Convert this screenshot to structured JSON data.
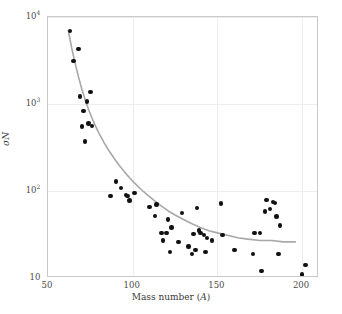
{
  "chart_data": {
    "type": "scatter",
    "title": "",
    "xlabel": "Mass number (A)",
    "ylabel": "σN",
    "xscale": "linear",
    "yscale": "log",
    "xlim": [
      50,
      210
    ],
    "ylim": [
      10,
      10000
    ],
    "grid": true,
    "legend": null,
    "xticks": [
      {
        "value": 50,
        "label": "50"
      },
      {
        "value": 100,
        "label": "100"
      },
      {
        "value": 150,
        "label": "150"
      },
      {
        "value": 200,
        "label": "200"
      }
    ],
    "yticks": [
      {
        "value": 10,
        "label": "10",
        "mantissa": "10",
        "exponent": ""
      },
      {
        "value": 100,
        "label": "10²",
        "mantissa": "10",
        "exponent": "2"
      },
      {
        "value": 1000,
        "label": "10³",
        "mantissa": "10",
        "exponent": "3"
      },
      {
        "value": 10000,
        "label": "10⁴",
        "mantissa": "10",
        "exponent": "4"
      }
    ],
    "marker": {
      "shape": "circle",
      "color": "#111111",
      "size_px": 4.4
    },
    "points": [
      {
        "x": 63,
        "y": 6900
      },
      {
        "x": 65,
        "y": 3100
      },
      {
        "x": 68,
        "y": 4300
      },
      {
        "x": 69,
        "y": 1220
      },
      {
        "x": 70,
        "y": 550
      },
      {
        "x": 71,
        "y": 830
      },
      {
        "x": 72,
        "y": 370
      },
      {
        "x": 73,
        "y": 1070
      },
      {
        "x": 74,
        "y": 600
      },
      {
        "x": 75,
        "y": 1380
      },
      {
        "x": 76,
        "y": 560
      },
      {
        "x": 87,
        "y": 88
      },
      {
        "x": 90,
        "y": 128
      },
      {
        "x": 93,
        "y": 108
      },
      {
        "x": 96,
        "y": 90
      },
      {
        "x": 97,
        "y": 87
      },
      {
        "x": 98,
        "y": 78
      },
      {
        "x": 101,
        "y": 95
      },
      {
        "x": 110,
        "y": 65
      },
      {
        "x": 113,
        "y": 52
      },
      {
        "x": 114,
        "y": 70
      },
      {
        "x": 117,
        "y": 33
      },
      {
        "x": 118,
        "y": 27
      },
      {
        "x": 120,
        "y": 33
      },
      {
        "x": 121,
        "y": 47
      },
      {
        "x": 122,
        "y": 20
      },
      {
        "x": 123,
        "y": 38
      },
      {
        "x": 127,
        "y": 26
      },
      {
        "x": 129,
        "y": 56
      },
      {
        "x": 133,
        "y": 23
      },
      {
        "x": 135,
        "y": 19
      },
      {
        "x": 136,
        "y": 32
      },
      {
        "x": 137,
        "y": 21
      },
      {
        "x": 138,
        "y": 64
      },
      {
        "x": 139,
        "y": 35
      },
      {
        "x": 140,
        "y": 33
      },
      {
        "x": 142,
        "y": 31
      },
      {
        "x": 143,
        "y": 20
      },
      {
        "x": 144,
        "y": 29
      },
      {
        "x": 147,
        "y": 27
      },
      {
        "x": 152,
        "y": 72
      },
      {
        "x": 153,
        "y": 31
      },
      {
        "x": 160,
        "y": 21
      },
      {
        "x": 171,
        "y": 19
      },
      {
        "x": 172,
        "y": 33
      },
      {
        "x": 175,
        "y": 33
      },
      {
        "x": 176,
        "y": 12
      },
      {
        "x": 178,
        "y": 58
      },
      {
        "x": 179,
        "y": 79
      },
      {
        "x": 181,
        "y": 62
      },
      {
        "x": 183,
        "y": 75
      },
      {
        "x": 184,
        "y": 73
      },
      {
        "x": 185,
        "y": 51
      },
      {
        "x": 186,
        "y": 19
      },
      {
        "x": 187,
        "y": 40
      },
      {
        "x": 200,
        "y": 11
      },
      {
        "x": 202,
        "y": 14
      }
    ],
    "fit_curve": {
      "name": "fitted trend",
      "color": "#a8a8a8",
      "width_px": 1.6,
      "x_start": 62,
      "x_end": 196,
      "points": [
        {
          "x": 62,
          "y": 7000
        },
        {
          "x": 64,
          "y": 4400
        },
        {
          "x": 66,
          "y": 2950
        },
        {
          "x": 68,
          "y": 2050
        },
        {
          "x": 70,
          "y": 1480
        },
        {
          "x": 72,
          "y": 1110
        },
        {
          "x": 74,
          "y": 860
        },
        {
          "x": 76,
          "y": 685
        },
        {
          "x": 78,
          "y": 560
        },
        {
          "x": 80,
          "y": 466
        },
        {
          "x": 83,
          "y": 362
        },
        {
          "x": 86,
          "y": 290
        },
        {
          "x": 89,
          "y": 238
        },
        {
          "x": 92,
          "y": 198
        },
        {
          "x": 95,
          "y": 167
        },
        {
          "x": 98,
          "y": 143
        },
        {
          "x": 101,
          "y": 124
        },
        {
          "x": 105,
          "y": 104
        },
        {
          "x": 109,
          "y": 89
        },
        {
          "x": 113,
          "y": 77
        },
        {
          "x": 117,
          "y": 67
        },
        {
          "x": 121,
          "y": 59
        },
        {
          "x": 125,
          "y": 53
        },
        {
          "x": 130,
          "y": 47
        },
        {
          "x": 135,
          "y": 42
        },
        {
          "x": 140,
          "y": 38
        },
        {
          "x": 145,
          "y": 35
        },
        {
          "x": 150,
          "y": 33
        },
        {
          "x": 156,
          "y": 31
        },
        {
          "x": 162,
          "y": 29
        },
        {
          "x": 168,
          "y": 28
        },
        {
          "x": 175,
          "y": 27
        },
        {
          "x": 182,
          "y": 27
        },
        {
          "x": 189,
          "y": 26
        },
        {
          "x": 196,
          "y": 26
        }
      ]
    }
  },
  "colors": {
    "marker": "#111111",
    "curve": "#a8a8a8",
    "grid": "#ededed",
    "frame": "#c9c9c9",
    "text": "#3a3a3a",
    "background": "#ffffff"
  }
}
